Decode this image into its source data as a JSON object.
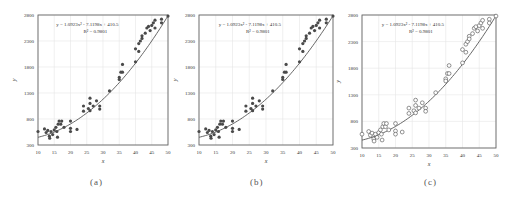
{
  "figure": {
    "panels": [
      {
        "id": "a",
        "caption": "(a)",
        "marker": "filled"
      },
      {
        "id": "b",
        "caption": "(b)",
        "marker": "filled"
      },
      {
        "id": "c",
        "caption": "(c)",
        "marker": "hollow"
      }
    ]
  },
  "colors": {
    "marker": "#4a4a4a",
    "curve": "#555555",
    "axis": "#666666",
    "grid": "#e6e6e6",
    "text": "#333333"
  },
  "chart_data": [
    {
      "panel": "a",
      "type": "scatter",
      "title": "",
      "caption": "(a)",
      "xlabel": "x",
      "ylabel": "y",
      "xlim": [
        10,
        50
      ],
      "ylim": [
        300,
        2800
      ],
      "xticks": [
        10,
        15,
        20,
        25,
        30,
        35,
        40,
        45,
        50
      ],
      "yticks": [
        300,
        800,
        1300,
        1800,
        2300,
        2800
      ],
      "grid": true,
      "annotation": {
        "equation": "y = 1.0923x² - 7.1198x + 410.5",
        "r2": "R² = 0.9801"
      },
      "trendline": {
        "type": "polynomial",
        "order": 2,
        "coefficients": [
          1.0923,
          -7.1198,
          410.5
        ]
      },
      "marker": "filled",
      "series": [
        {
          "name": "observations",
          "points": [
            [
              10,
              560
            ],
            [
              12,
              610
            ],
            [
              12.5,
              540
            ],
            [
              13,
              580
            ],
            [
              13.5,
              470
            ],
            [
              13.6,
              430
            ],
            [
              14,
              560
            ],
            [
              14.5,
              500
            ],
            [
              15,
              590
            ],
            [
              15.5,
              640
            ],
            [
              15.8,
              560
            ],
            [
              16,
              450
            ],
            [
              16.2,
              700
            ],
            [
              16.5,
              760
            ],
            [
              17,
              700
            ],
            [
              17.3,
              760
            ],
            [
              18,
              640
            ],
            [
              20,
              760
            ],
            [
              20,
              620
            ],
            [
              20,
              560
            ],
            [
              22,
              600
            ],
            [
              24,
              950
            ],
            [
              24,
              1050
            ],
            [
              25.5,
              1000
            ],
            [
              26,
              1100
            ],
            [
              26,
              1200
            ],
            [
              26,
              960
            ],
            [
              27,
              1050
            ],
            [
              28,
              1150
            ],
            [
              29,
              1050
            ],
            [
              29,
              990
            ],
            [
              32,
              1340
            ],
            [
              35,
              1600
            ],
            [
              35.5,
              1700
            ],
            [
              35,
              1560
            ],
            [
              36,
              1700
            ],
            [
              36,
              1850
            ],
            [
              40,
              1900
            ],
            [
              40,
              2150
            ],
            [
              41,
              2250
            ],
            [
              41,
              2100
            ],
            [
              41.5,
              2300
            ],
            [
              42,
              2400
            ],
            [
              42,
              2350
            ],
            [
              43,
              2450
            ],
            [
              43.5,
              2550
            ],
            [
              44,
              2580
            ],
            [
              44.5,
              2500
            ],
            [
              45,
              2600
            ],
            [
              45.5,
              2650
            ],
            [
              46,
              2550
            ],
            [
              46,
              2700
            ],
            [
              48,
              2720
            ],
            [
              48,
              2650
            ],
            [
              50,
              2780
            ]
          ]
        }
      ]
    },
    {
      "panel": "b",
      "type": "scatter",
      "title": "",
      "caption": "(b)",
      "xlabel": "x",
      "ylabel": "y",
      "xlim": [
        10,
        50
      ],
      "ylim": [
        300,
        2800
      ],
      "xticks": [
        10,
        15,
        20,
        25,
        30,
        35,
        40,
        45,
        50
      ],
      "yticks": [
        300,
        800,
        1300,
        1800,
        2300,
        2800
      ],
      "grid": true,
      "annotation": {
        "equation": "y = 1.0923x² - 7.1198x + 410.5",
        "r2": "R² = 0.9801"
      },
      "trendline": {
        "type": "polynomial",
        "order": 2,
        "coefficients": [
          1.0923,
          -7.1198,
          410.5
        ]
      },
      "marker": "filled",
      "series": [
        {
          "name": "observations",
          "points": [
            [
              10,
              560
            ],
            [
              12,
              610
            ],
            [
              12.5,
              540
            ],
            [
              13,
              580
            ],
            [
              13.5,
              470
            ],
            [
              13.6,
              430
            ],
            [
              14,
              560
            ],
            [
              14.5,
              500
            ],
            [
              15,
              590
            ],
            [
              15.5,
              640
            ],
            [
              15.8,
              560
            ],
            [
              16,
              450
            ],
            [
              16.2,
              700
            ],
            [
              16.5,
              760
            ],
            [
              17,
              700
            ],
            [
              17.3,
              760
            ],
            [
              18,
              640
            ],
            [
              20,
              760
            ],
            [
              20,
              620
            ],
            [
              20,
              560
            ],
            [
              22,
              600
            ],
            [
              24,
              950
            ],
            [
              24,
              1050
            ],
            [
              25.5,
              1000
            ],
            [
              26,
              1100
            ],
            [
              26,
              1200
            ],
            [
              26,
              960
            ],
            [
              27,
              1050
            ],
            [
              28,
              1150
            ],
            [
              29,
              1050
            ],
            [
              29,
              990
            ],
            [
              32,
              1340
            ],
            [
              35,
              1600
            ],
            [
              35.5,
              1700
            ],
            [
              35,
              1560
            ],
            [
              36,
              1700
            ],
            [
              36,
              1850
            ],
            [
              40,
              1900
            ],
            [
              40,
              2150
            ],
            [
              41,
              2250
            ],
            [
              41,
              2100
            ],
            [
              41.5,
              2300
            ],
            [
              42,
              2400
            ],
            [
              42,
              2350
            ],
            [
              43,
              2450
            ],
            [
              43.5,
              2550
            ],
            [
              44,
              2580
            ],
            [
              44.5,
              2500
            ],
            [
              45,
              2600
            ],
            [
              45.5,
              2650
            ],
            [
              46,
              2550
            ],
            [
              46,
              2700
            ],
            [
              48,
              2720
            ],
            [
              48,
              2650
            ],
            [
              50,
              2780
            ]
          ]
        }
      ]
    },
    {
      "panel": "c",
      "type": "scatter",
      "title": "",
      "caption": "(c)",
      "xlabel": "x",
      "ylabel": "y",
      "xlim": [
        10,
        50
      ],
      "ylim": [
        300,
        2800
      ],
      "xticks": [
        10,
        15,
        20,
        25,
        30,
        35,
        40,
        45,
        50
      ],
      "yticks": [
        300,
        800,
        1300,
        1800,
        2300,
        2800
      ],
      "grid": true,
      "annotation": {
        "equation": "y = 1.0923x² - 7.1198x + 410.5",
        "r2": "R² = 0.9801"
      },
      "trendline": {
        "type": "polynomial",
        "order": 2,
        "coefficients": [
          1.0923,
          -7.1198,
          410.5
        ]
      },
      "marker": "hollow",
      "series": [
        {
          "name": "observations",
          "points": [
            [
              10,
              560
            ],
            [
              12,
              610
            ],
            [
              12.5,
              540
            ],
            [
              13,
              580
            ],
            [
              13.5,
              470
            ],
            [
              13.6,
              430
            ],
            [
              14,
              560
            ],
            [
              14.5,
              500
            ],
            [
              15,
              590
            ],
            [
              15.5,
              640
            ],
            [
              15.8,
              560
            ],
            [
              16,
              450
            ],
            [
              16.2,
              700
            ],
            [
              16.5,
              760
            ],
            [
              17,
              700
            ],
            [
              17.3,
              760
            ],
            [
              18,
              640
            ],
            [
              20,
              760
            ],
            [
              20,
              620
            ],
            [
              20,
              560
            ],
            [
              22,
              600
            ],
            [
              24,
              950
            ],
            [
              24,
              1050
            ],
            [
              25.5,
              1000
            ],
            [
              26,
              1100
            ],
            [
              26,
              1200
            ],
            [
              26,
              960
            ],
            [
              27,
              1050
            ],
            [
              28,
              1150
            ],
            [
              29,
              1050
            ],
            [
              29,
              990
            ],
            [
              32,
              1340
            ],
            [
              35,
              1600
            ],
            [
              35.5,
              1700
            ],
            [
              35,
              1560
            ],
            [
              36,
              1700
            ],
            [
              36,
              1850
            ],
            [
              40,
              1900
            ],
            [
              40,
              2150
            ],
            [
              41,
              2250
            ],
            [
              41,
              2100
            ],
            [
              41.5,
              2300
            ],
            [
              42,
              2400
            ],
            [
              42,
              2350
            ],
            [
              43,
              2450
            ],
            [
              43.5,
              2550
            ],
            [
              44,
              2580
            ],
            [
              44.5,
              2500
            ],
            [
              45,
              2600
            ],
            [
              45.5,
              2650
            ],
            [
              46,
              2550
            ],
            [
              46,
              2700
            ],
            [
              48,
              2720
            ],
            [
              48,
              2650
            ],
            [
              50,
              2780
            ]
          ]
        }
      ]
    }
  ]
}
